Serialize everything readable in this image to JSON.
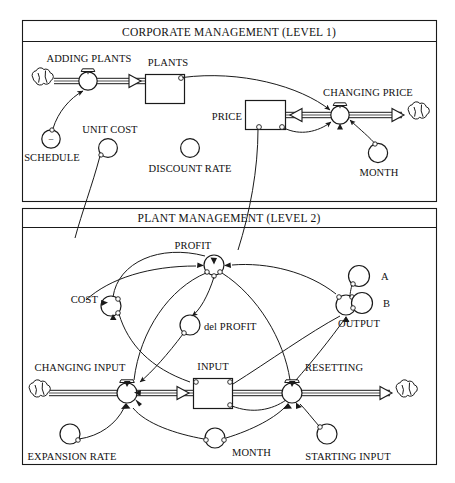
{
  "diagram": {
    "kind": "stock-and-flow",
    "panels": [
      {
        "id": "level1",
        "title": "CORPORATE MANAGEMENT (LEVEL 1)",
        "stocks": [
          {
            "name": "PLANTS",
            "label": "PLANTS"
          },
          {
            "name": "PRICE",
            "label": "PRICE"
          }
        ],
        "flows": [
          {
            "name": "ADDING PLANTS",
            "label": "ADDING PLANTS",
            "source": "cloud",
            "target": "PLANTS"
          },
          {
            "name": "CHANGING PRICE",
            "label": "CHANGING PRICE",
            "source": "cloud",
            "target": "PRICE"
          }
        ],
        "auxiliaries": [
          {
            "name": "SCHEDULE",
            "label": "SCHEDULE",
            "sign": "−"
          },
          {
            "name": "UNIT COST",
            "label": "UNIT COST"
          },
          {
            "name": "DISCOUNT RATE",
            "label": "DISCOUNT RATE"
          },
          {
            "name": "MONTH",
            "label": "MONTH"
          }
        ]
      },
      {
        "id": "level2",
        "title": "PLANT MANAGEMENT (LEVEL 2)",
        "stocks": [
          {
            "name": "INPUT",
            "label": "INPUT"
          }
        ],
        "flows": [
          {
            "name": "CHANGING INPUT",
            "label": "CHANGING INPUT",
            "source": "cloud",
            "target": "INPUT"
          },
          {
            "name": "RESETTING",
            "label": "RESETTING",
            "source": "INPUT",
            "target": "cloud"
          }
        ],
        "auxiliaries": [
          {
            "name": "PROFIT",
            "label": "PROFIT"
          },
          {
            "name": "COST",
            "label": "COST"
          },
          {
            "name": "del PROFIT",
            "label": "del PROFIT"
          },
          {
            "name": "OUTPUT",
            "label": "OUTPUT"
          },
          {
            "name": "A",
            "label": "A"
          },
          {
            "name": "B",
            "label": "B"
          },
          {
            "name": "EXPANSION RATE",
            "label": "EXPANSION RATE"
          },
          {
            "name": "MONTH",
            "label": "MONTH"
          },
          {
            "name": "STARTING INPUT",
            "label": "STARTING INPUT"
          }
        ]
      }
    ],
    "colors": {
      "ink": "#1a1a1a",
      "paper": "#ffffff",
      "pipe_core": "#8a8a8a"
    }
  }
}
